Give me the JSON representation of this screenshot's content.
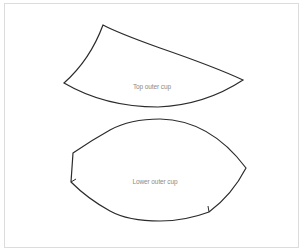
{
  "diagram": {
    "type": "sewing-pattern-pieces",
    "border_color": "#dcdcdc",
    "stroke_color": "#2b2b2b",
    "label_color": "#8a8a8a",
    "pieces": [
      {
        "id": "top-outer-cup",
        "label": "Top outer cup"
      },
      {
        "id": "lower-outer-cup",
        "label": "Lower outer cup"
      }
    ]
  }
}
